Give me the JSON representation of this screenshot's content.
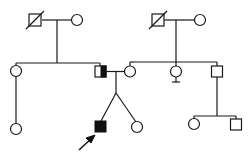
{
  "diagram": {
    "type": "pedigree",
    "colors": {
      "line": "#1a1a1a",
      "affected_fill": "#111111",
      "background": "#ffffff"
    },
    "generations": [
      {
        "label": "I",
        "individuals": [
          {
            "id": "I-1",
            "sex": "male",
            "status": "deceased"
          },
          {
            "id": "I-2",
            "sex": "female",
            "status": "unaffected"
          },
          {
            "id": "I-3",
            "sex": "male",
            "status": "deceased"
          },
          {
            "id": "I-4",
            "sex": "female",
            "status": "unaffected"
          }
        ]
      },
      {
        "label": "II",
        "individuals": [
          {
            "id": "II-1",
            "sex": "female",
            "status": "unaffected"
          },
          {
            "id": "II-2",
            "sex": "male",
            "status": "half-shaded (partially affected/carrier)"
          },
          {
            "id": "II-3",
            "sex": "female",
            "status": "unaffected"
          },
          {
            "id": "II-4",
            "sex": "female",
            "status": "unaffected, no offspring mark"
          },
          {
            "id": "II-5",
            "sex": "male",
            "status": "unaffected"
          }
        ]
      },
      {
        "label": "III",
        "individuals": [
          {
            "id": "III-1",
            "sex": "female",
            "status": "unaffected"
          },
          {
            "id": "III-2",
            "sex": "male",
            "status": "affected",
            "proband": true
          },
          {
            "id": "III-3",
            "sex": "female",
            "status": "unaffected",
            "twin_of": "III-2"
          },
          {
            "id": "III-4",
            "sex": "female",
            "status": "unaffected"
          },
          {
            "id": "III-5",
            "sex": "male",
            "status": "unaffected"
          }
        ]
      }
    ],
    "legend": {
      "proband_marker": "arrow"
    }
  }
}
